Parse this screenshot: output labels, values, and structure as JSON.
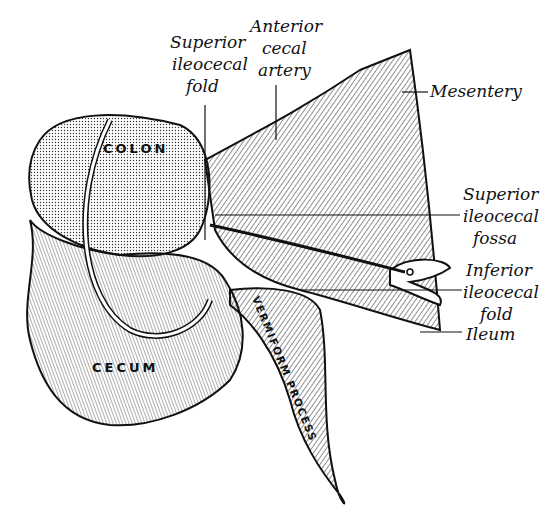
{
  "figure": {
    "labels": {
      "superior_ileocecal_fold": [
        "Superior",
        "ileocecal",
        "fold"
      ],
      "anterior_cecal_artery": [
        "Anterior",
        "cecal",
        "artery"
      ],
      "mesentery": [
        "Mesentery"
      ],
      "superior_ileocecal_fossa": [
        "Superior",
        "ileocecal",
        "fossa"
      ],
      "inferior_ileocecal_fold": [
        "Inferior",
        "ileocecal",
        "fold"
      ],
      "ileum": [
        "Ileum"
      ],
      "colon": "COLON",
      "cecum": "CECUM",
      "vermiform_process": "VERMIFORM PROCESS"
    }
  }
}
